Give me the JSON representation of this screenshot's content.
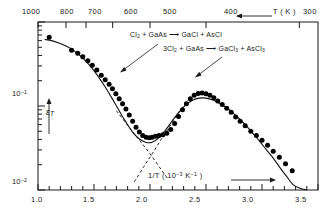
{
  "chart_data": {
    "type": "line",
    "title": "",
    "xlabel": "1/T (10^-3 K^-1)",
    "ylabel": "ε_T",
    "xlim": [
      1.0,
      3.5
    ],
    "ylim": [
      0.01,
      1.0
    ],
    "yscale": "log",
    "grid": false,
    "legend": "none",
    "x_ticks": [
      "1.0",
      "1.5",
      "2.0",
      "2.5",
      "3.0",
      "3.5"
    ],
    "x_tick_values": [
      1.0,
      1.5,
      2.0,
      2.5,
      3.0,
      3.5
    ],
    "x_minor_step": 0.1,
    "y_ticks": [
      "10⁻¹",
      "10⁻²"
    ],
    "y_tick_values": [
      0.1,
      0.01
    ],
    "secondary_axis": {
      "position": "top",
      "label": "T (K)",
      "arrow": "left",
      "ticks": [
        "1000",
        "800",
        "700",
        "600",
        "500",
        "400",
        "300"
      ],
      "tick_values": [
        1000,
        800,
        700,
        600,
        500,
        400,
        300
      ],
      "tick_x_positions": [
        1.0,
        1.25,
        1.4286,
        1.6667,
        2.0,
        2.5,
        3.3333
      ]
    },
    "annotations": [
      {
        "text": "Cl₂ + GaAs ⟶ GaCl + AsCl",
        "x": 1.72,
        "y": 0.56,
        "arrow_to": [
          1.52,
          0.3
        ]
      },
      {
        "text": "3Cl₂ + GaAs ⟶ GaCl₃ + AsCl₃",
        "x": 2.18,
        "y": 0.44,
        "arrow_to": [
          2.02,
          0.205
        ]
      }
    ],
    "series": [
      {
        "name": "model-curve",
        "style": "solid",
        "x": [
          1.06,
          1.12,
          1.18,
          1.24,
          1.3,
          1.36,
          1.42,
          1.48,
          1.54,
          1.6,
          1.66,
          1.72,
          1.78,
          1.84,
          1.9,
          1.96,
          2.02,
          2.08,
          2.14,
          2.2,
          2.26,
          2.32,
          2.38,
          2.44,
          2.5,
          2.56,
          2.62,
          2.68,
          2.74,
          2.8,
          2.86,
          2.92,
          2.98,
          3.04,
          3.1,
          3.16,
          3.22,
          3.28,
          3.34,
          3.4
        ],
        "y": [
          0.62,
          0.6,
          0.565,
          0.525,
          0.475,
          0.415,
          0.35,
          0.285,
          0.222,
          0.168,
          0.124,
          0.09,
          0.066,
          0.05,
          0.041,
          0.037,
          0.037,
          0.042,
          0.052,
          0.067,
          0.085,
          0.103,
          0.117,
          0.124,
          0.124,
          0.118,
          0.108,
          0.096,
          0.083,
          0.07,
          0.058,
          0.047,
          0.038,
          0.03,
          0.024,
          0.0185,
          0.0145,
          0.0115,
          0.0105,
          0.01
        ]
      },
      {
        "name": "asymptote-left",
        "style": "dashed",
        "x": [
          1.7,
          1.8,
          1.9,
          2.0,
          2.1,
          2.16
        ],
        "y": [
          0.088,
          0.059,
          0.04,
          0.027,
          0.0175,
          0.0135
        ]
      },
      {
        "name": "asymptote-right",
        "style": "dashed",
        "x": [
          1.86,
          1.94,
          2.02,
          2.1,
          2.18,
          2.26,
          2.34
        ],
        "y": [
          0.0125,
          0.0185,
          0.027,
          0.04,
          0.058,
          0.084,
          0.118
        ]
      },
      {
        "name": "measured-points",
        "style": "scatter",
        "marker": "filled-circle",
        "x": [
          1.1,
          1.3,
          1.355,
          1.4,
          1.445,
          1.485,
          1.525,
          1.565,
          1.6,
          1.635,
          1.665,
          1.695,
          1.725,
          1.755,
          1.785,
          1.815,
          1.845,
          1.875,
          1.905,
          1.935,
          1.965,
          1.995,
          2.02,
          2.05,
          2.08,
          2.115,
          2.15,
          2.185,
          2.22,
          2.255,
          2.29,
          2.325,
          2.36,
          2.395,
          2.43,
          2.465,
          2.5,
          2.535,
          2.57,
          2.605,
          2.645,
          2.685,
          2.725,
          2.765,
          2.805,
          2.85,
          2.9,
          2.95,
          3.0,
          3.05,
          3.1,
          3.155,
          3.21,
          3.27
        ],
        "y": [
          0.66,
          0.46,
          0.425,
          0.385,
          0.345,
          0.305,
          0.268,
          0.232,
          0.205,
          0.181,
          0.16,
          0.14,
          0.122,
          0.106,
          0.092,
          0.078,
          0.066,
          0.056,
          0.049,
          0.0445,
          0.0425,
          0.042,
          0.0425,
          0.0435,
          0.0445,
          0.0455,
          0.0475,
          0.0525,
          0.062,
          0.075,
          0.09,
          0.106,
          0.122,
          0.134,
          0.141,
          0.143,
          0.14,
          0.134,
          0.125,
          0.115,
          0.104,
          0.094,
          0.084,
          0.074,
          0.066,
          0.058,
          0.05,
          0.0445,
          0.039,
          0.034,
          0.029,
          0.0245,
          0.0205,
          0.017
        ]
      }
    ]
  },
  "axes": {
    "top_label": "T ( K )",
    "y_label": "ε",
    "y_label_sub": "T",
    "x_label_main": "1/T ( 10",
    "x_label_exp1": "−3",
    "x_label_mid": " K",
    "x_label_exp2": "−1",
    "x_label_end": " )",
    "top_ticks": [
      "1000",
      "800",
      "700",
      "600",
      "500",
      "400",
      "300"
    ],
    "bottom_ticks": [
      "1.0",
      "1.5",
      "2.0",
      "2.5",
      "3.0",
      "3.5"
    ],
    "y_tick_hi_base": "10",
    "y_tick_hi_exp": "−1",
    "y_tick_lo_base": "10",
    "y_tick_lo_exp": "−2"
  },
  "reactions": {
    "first": {
      "pre": "Cl",
      "pre_sub": "2",
      "mid": " + GaAs",
      "arrow": "⟶",
      "post": "GaCl  + AsCl"
    },
    "second": {
      "pre": "3Cl",
      "pre_sub": "2",
      "mid": " + GaAs",
      "arrow": "⟶",
      "post_a": "GaCl",
      "post_a_sub": "3",
      "post_mid": " + AsCl",
      "post_b_sub": "3"
    }
  },
  "colors": {
    "ink": "#1a1a1a",
    "curve": "#111111",
    "marker": "#000000",
    "background": "#ffffff"
  }
}
